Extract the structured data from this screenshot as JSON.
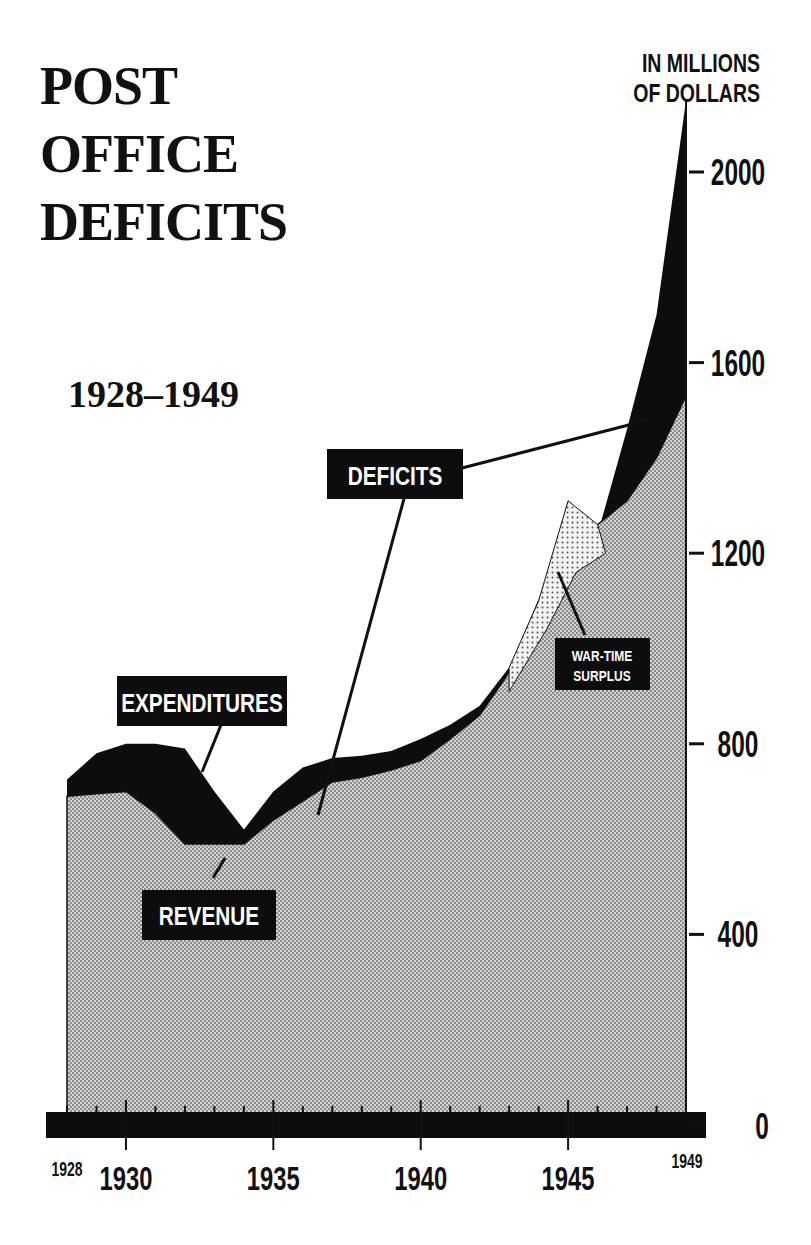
{
  "title_lines": [
    "POST",
    "OFFICE",
    "DEFICITS"
  ],
  "subtitle": "1928–1949",
  "unit_lines": [
    "IN MILLIONS",
    "OF DOLLARS"
  ],
  "labels": {
    "expenditures": "EXPENDITURES",
    "revenue": "REVENUE",
    "deficits": "DEFICITS",
    "surplus_line1": "WAR-TIME",
    "surplus_line2": "SURPLUS"
  },
  "y_ticks": [
    "0",
    "400",
    "800",
    "1200",
    "1600",
    "2000"
  ],
  "x_ticks_major": [
    "1930",
    "1935",
    "1940",
    "1945"
  ],
  "x_ticks_minor_labels": [
    "1928",
    "1949"
  ],
  "colors": {
    "deficit_fill": "#0d0d0d",
    "revenue_fill": "#bdbdbd",
    "surplus_fill": "#e6e6e6",
    "text": "#111111",
    "background": "#ffffff"
  },
  "chart_data": {
    "type": "area",
    "xlabel": "",
    "ylabel": "IN MILLIONS OF DOLLARS",
    "x": [
      1928,
      1929,
      1930,
      1931,
      1932,
      1933,
      1934,
      1935,
      1936,
      1937,
      1938,
      1939,
      1940,
      1941,
      1942,
      1943,
      1944,
      1945,
      1946,
      1947,
      1948,
      1949
    ],
    "series": [
      {
        "name": "EXPENDITURES",
        "values": [
          725,
          780,
          800,
          800,
          790,
          700,
          620,
          700,
          750,
          770,
          775,
          785,
          810,
          840,
          880,
          960,
          1080,
          1310,
          1240,
          1460,
          1700,
          2150
        ]
      },
      {
        "name": "REVENUE",
        "values": [
          690,
          695,
          700,
          655,
          590,
          590,
          590,
          640,
          680,
          720,
          730,
          745,
          765,
          810,
          860,
          950,
          1100,
          1200,
          1260,
          1310,
          1400,
          1530
        ]
      }
    ],
    "annotations": [
      "EXPENDITURES",
      "REVENUE",
      "DEFICITS",
      "WAR-TIME SURPLUS"
    ],
    "ylim": [
      0,
      2100
    ],
    "yticks": [
      0,
      400,
      800,
      1200,
      1600,
      2000
    ],
    "xticks": [
      1928,
      1930,
      1935,
      1940,
      1945,
      1949
    ],
    "grid": false,
    "legend": "none (inline labels)"
  }
}
